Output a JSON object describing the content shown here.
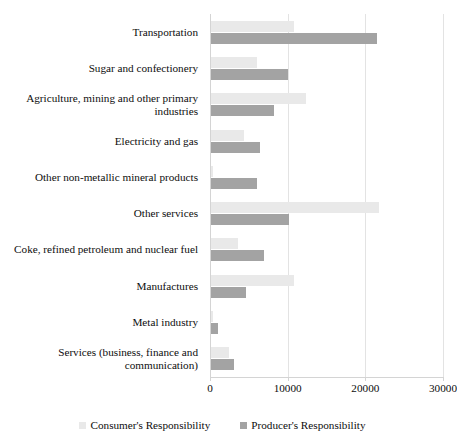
{
  "chart_data": {
    "type": "bar",
    "orientation": "horizontal",
    "title": "",
    "subtitle": "",
    "xlabel": "",
    "ylabel": "",
    "xlim": [
      0,
      30000
    ],
    "grid": true,
    "legend_position": "bottom",
    "categories": [
      "Transportation",
      "Sugar and confectionery",
      "Agriculture, mining and other primary industries",
      "Electricity and gas",
      "Other non-metallic mineral products",
      "Other services",
      "Coke, refined petroleum and nuclear fuel",
      "Manufactures",
      "Metal industry",
      "Services (business, finance and communication)"
    ],
    "series": [
      {
        "name": "Consumer's Responsibility",
        "color": "#e9e9e9",
        "values": [
          10700,
          5900,
          12200,
          4200,
          300,
          21600,
          3500,
          10700,
          200,
          2300
        ]
      },
      {
        "name": "Producer's Responsibility",
        "color": "#a3a3a3",
        "values": [
          21400,
          9900,
          8100,
          6300,
          5900,
          10000,
          6800,
          4500,
          900,
          3000
        ]
      }
    ],
    "xticks": [
      0,
      10000,
      20000,
      30000
    ],
    "xticklabels": [
      "0",
      "10000",
      "20000",
      "30000"
    ]
  },
  "legend": {
    "entries": [
      {
        "label": "Consumer's Responsibility"
      },
      {
        "label": "Producer's Responsibility"
      }
    ]
  }
}
